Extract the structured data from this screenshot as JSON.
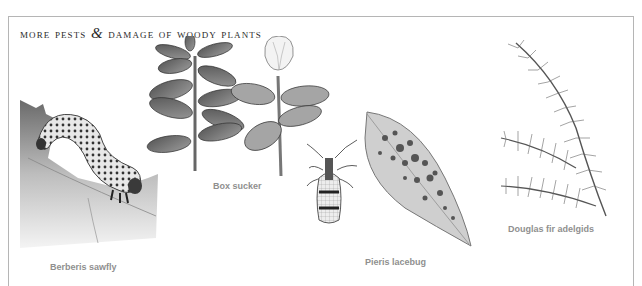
{
  "page": {
    "title_part1": "More pests",
    "title_amp": "&",
    "title_part2": "damage of woody plants"
  },
  "specimens": [
    {
      "id": "berberis-sawfly",
      "label": "Berberis sawfly",
      "illustration": "caterpillar-on-leaf"
    },
    {
      "id": "box-sucker",
      "label": "Box sucker",
      "illustration": "box-shoots"
    },
    {
      "id": "pieris-lacebug",
      "label": "Pieris lacebug",
      "illustration": "lacebug-and-mottled-leaf"
    },
    {
      "id": "douglas-fir-adelgids",
      "label": "Douglas fir adelgids",
      "illustration": "fir-branch"
    }
  ],
  "colors": {
    "frame": "#b5b5b5",
    "title": "#2b2b2b",
    "label": "#8f8f8f"
  }
}
